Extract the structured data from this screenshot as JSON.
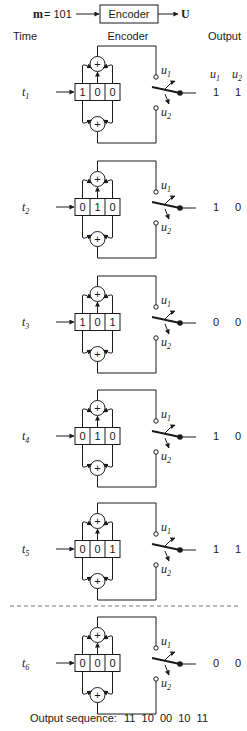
{
  "header": {
    "message_label": "m",
    "message_value": "= 101",
    "encoder_box_label": "Encoder",
    "output_symbol": "U"
  },
  "columns": {
    "time": "Time",
    "encoder": "Encoder",
    "output": "Output",
    "u1_label": "u",
    "u1_sub": "1",
    "u2_label": "u",
    "u2_sub": "2"
  },
  "switch_labels": {
    "u": "u",
    "sub1": "1",
    "sub2": "2"
  },
  "adder_symbol": "+",
  "steps": [
    {
      "time_label": "t",
      "time_sub": "1",
      "register": [
        "1",
        "0",
        "0"
      ],
      "outputs": [
        "1",
        "1"
      ],
      "row_y": 92
    },
    {
      "time_label": "t",
      "time_sub": "2",
      "register": [
        "0",
        "1",
        "0"
      ],
      "outputs": [
        "1",
        "0"
      ],
      "row_y": 207
    },
    {
      "time_label": "t",
      "time_sub": "3",
      "register": [
        "1",
        "0",
        "1"
      ],
      "outputs": [
        "0",
        "0"
      ],
      "row_y": 322
    },
    {
      "time_label": "t",
      "time_sub": "4",
      "register": [
        "0",
        "1",
        "0"
      ],
      "outputs": [
        "1",
        "0"
      ],
      "row_y": 436
    },
    {
      "time_label": "t",
      "time_sub": "5",
      "register": [
        "0",
        "0",
        "1"
      ],
      "outputs": [
        "1",
        "1"
      ],
      "row_y": 549
    },
    {
      "time_label": "t",
      "time_sub": "6",
      "register": [
        "0",
        "0",
        "0"
      ],
      "outputs": [
        "0",
        "0"
      ],
      "row_y": 663
    }
  ],
  "separator_y": 606,
  "footer": {
    "label": "Output sequence:",
    "sequence": "11  10  00  10  11"
  }
}
